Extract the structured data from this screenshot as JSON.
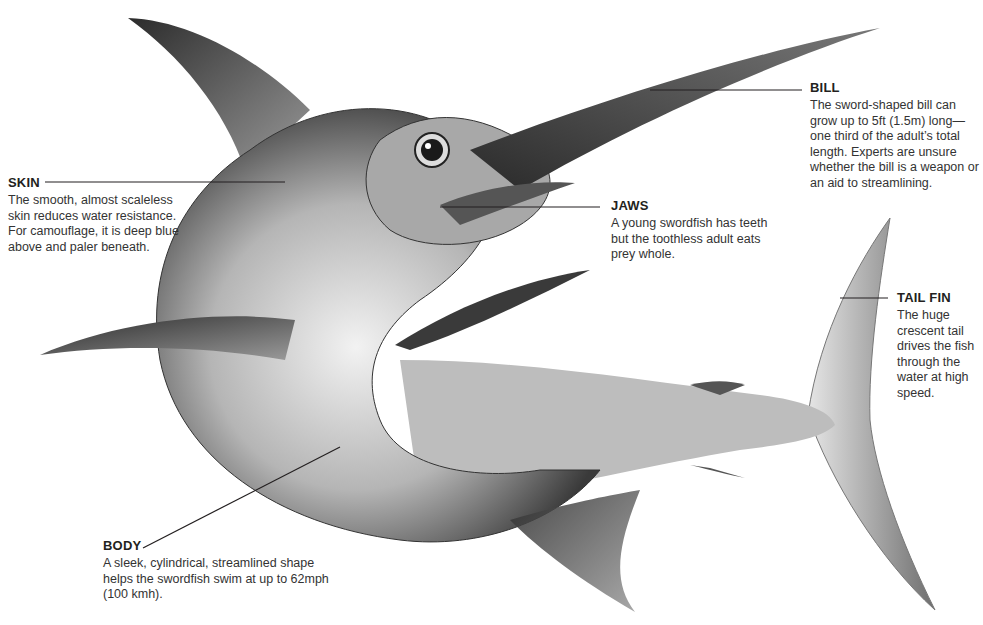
{
  "diagram": {
    "colors": {
      "background": "#ffffff",
      "text": "#231f20",
      "leader_line": "#231f20"
    }
  },
  "labels": {
    "skin": {
      "title": "SKIN",
      "text": "The smooth, almost scaleless skin reduces water resistance. For camouflage, it is deep blue above and paler beneath."
    },
    "bill": {
      "title": "BILL",
      "text": "The sword-shaped bill can grow up to 5ft (1.5m) long—one third of the adult’s total length. Experts are unsure whether the bill is a weapon or an aid to streamlining."
    },
    "jaws": {
      "title": "JAWS",
      "text": "A young swordfish has teeth but the toothless adult eats prey whole."
    },
    "tail": {
      "title": "TAIL FIN",
      "text": "The huge crescent tail drives the fish through the water at high speed."
    },
    "body": {
      "title": "BODY",
      "text": "A sleek, cylindrical, streamlined shape helps the swordfish swim at up to 62mph (100 kmh)."
    }
  }
}
